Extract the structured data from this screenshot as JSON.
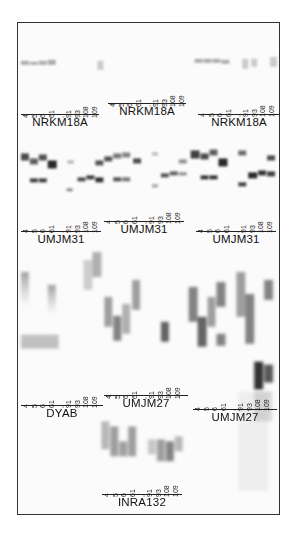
{
  "figure": {
    "type": "gel electrophoresis autoradiograph",
    "lane_labels": [
      "4",
      "5",
      "6",
      "61",
      ",",
      "91",
      "93",
      "108",
      "109"
    ],
    "band_color": "#2a2a2a",
    "frame_color": "#333333"
  },
  "panels": [
    {
      "id": "nrkm18a-1",
      "name": "NRKM18A",
      "x": 3,
      "label_y": 77,
      "rule_y": 91,
      "name_y": 94
    },
    {
      "id": "nrkm18a-2",
      "name": "NRKM18A",
      "x": 90,
      "label_y": 66,
      "rule_y": 81,
      "name_y": 83
    },
    {
      "id": "nrkm18a-3",
      "name": "NRKM18A",
      "x": 180,
      "label_y": 76,
      "rule_y": 91,
      "name_y": 93
    },
    {
      "id": "umjm31-1",
      "name": "UMJM31",
      "x": 3,
      "label_y": 192,
      "rule_y": 208,
      "name_y": 210
    },
    {
      "id": "umjm31-2",
      "name": "UMJM31",
      "x": 86,
      "label_y": 183,
      "rule_y": 198,
      "name_y": 200
    },
    {
      "id": "umjm31-3",
      "name": "UMJM31",
      "x": 178,
      "label_y": 192,
      "rule_y": 208,
      "name_y": 210
    },
    {
      "id": "dyab",
      "name": "DYAB",
      "x": 3,
      "label_y": 367,
      "rule_y": 382,
      "name_y": 384
    },
    {
      "id": "umjm27-1",
      "name": "UMJM27",
      "x": 86,
      "label_y": 358,
      "rule_y": 372,
      "name_y": 374
    },
    {
      "id": "umjm27-2",
      "name": "UMJM27",
      "x": 175,
      "label_y": 370,
      "rule_y": 386,
      "name_y": 388
    },
    {
      "id": "inra132",
      "name": "INRA132",
      "x": 84,
      "label_y": 456,
      "rule_y": 471,
      "name_y": 473
    }
  ]
}
